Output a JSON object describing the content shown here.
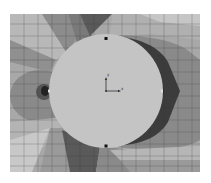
{
  "figure": {
    "type": "fem-contour-plot",
    "colormap": "grayscale",
    "plate": {
      "x": 10,
      "y": 14,
      "width": 190,
      "height": 158
    },
    "hole": {
      "cx": 106,
      "cy": 91,
      "r": 57,
      "fill": "#c4c4c4"
    },
    "nodes": [
      {
        "name": "top",
        "x": 106,
        "y": 39
      },
      {
        "name": "bottom",
        "x": 106,
        "y": 146
      },
      {
        "name": "left",
        "x": 49,
        "y": 91
      },
      {
        "name": "right",
        "x": 162,
        "y": 91
      }
    ],
    "triad": {
      "x_label": "x",
      "y_label": "y"
    },
    "colors": {
      "lightest": "#cfcfcf",
      "light": "#b4b4b4",
      "mid_light": "#9c9c9c",
      "mid": "#858585",
      "mid_dark": "#6a6a6a",
      "dark": "#4a4a4a",
      "darkest": "#262626",
      "grid": "#3a3a3a"
    }
  }
}
